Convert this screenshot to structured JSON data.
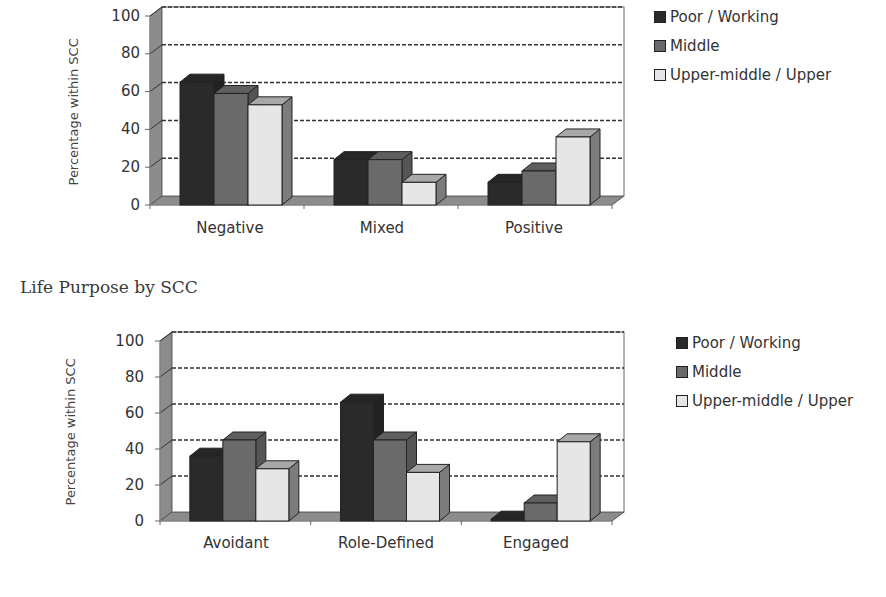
{
  "chart_data": [
    {
      "type": "bar",
      "title": "",
      "xlabel": "",
      "ylabel": "Percentage within SCC",
      "ylim": [
        0,
        100
      ],
      "yticks": [
        "0",
        "20",
        "40",
        "60",
        "80",
        "100"
      ],
      "grid": true,
      "style": "3d-clustered",
      "legend_position": "right",
      "categories": [
        "Negative",
        "Mixed",
        "Positive"
      ],
      "series": [
        {
          "name": "Poor / Working",
          "values": [
            65,
            24,
            12
          ],
          "color": "#2a2a2a"
        },
        {
          "name": "Middle",
          "values": [
            59,
            24,
            18
          ],
          "color": "#6a6a6a"
        },
        {
          "name": "Upper-middle / Upper",
          "values": [
            53,
            12,
            36
          ],
          "color": "#e6e6e6"
        }
      ]
    },
    {
      "type": "bar",
      "title": "Life Purpose by SCC",
      "xlabel": "",
      "ylabel": "Percentage within SCC",
      "ylim": [
        0,
        100
      ],
      "yticks": [
        "0",
        "20",
        "40",
        "60",
        "80",
        "100"
      ],
      "grid": true,
      "style": "3d-clustered",
      "legend_position": "right",
      "categories": [
        "Avoidant",
        "Role-Defined",
        "Engaged"
      ],
      "series": [
        {
          "name": "Poor / Working",
          "values": [
            36,
            66,
            1
          ],
          "color": "#2a2a2a"
        },
        {
          "name": "Middle",
          "values": [
            45,
            45,
            10
          ],
          "color": "#6a6a6a"
        },
        {
          "name": "Upper-middle / Upper",
          "values": [
            29,
            27,
            44
          ],
          "color": "#e6e6e6"
        }
      ]
    }
  ],
  "charts": [
    {
      "ylabel": "Percentage within SCC",
      "yticks": [
        "0",
        "20",
        "40",
        "60",
        "80",
        "100"
      ],
      "categories": [
        "Negative",
        "Mixed",
        "Positive"
      ],
      "legend": [
        "Poor / Working",
        "Middle",
        "Upper-middle / Upper"
      ]
    },
    {
      "title": "Life Purpose by SCC",
      "ylabel": "Percentage within SCC",
      "yticks": [
        "0",
        "20",
        "40",
        "60",
        "80",
        "100"
      ],
      "categories": [
        "Avoidant",
        "Role-Defined",
        "Engaged"
      ],
      "legend": [
        "Poor / Working",
        "Middle",
        "Upper-middle / Upper"
      ]
    }
  ]
}
